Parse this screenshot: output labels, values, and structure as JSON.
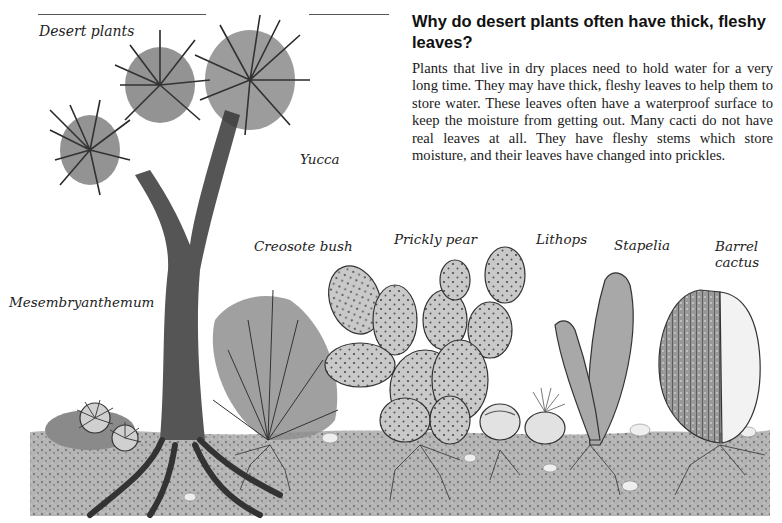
{
  "page": {
    "section_title": "Desert plants",
    "heading": "Why do desert plants often have thick, fleshy leaves?",
    "body": "Plants that live in dry places need to hold water for a very long time. They may have thick, fleshy leaves to help them to store water. These leaves often have a waterproof surface to keep the moisture from getting out. Many cacti do not have real leaves at all. They have fleshy stems which store moisture, and their leaves have changed into prickles."
  },
  "illustration": {
    "description": "Pencil illustration of desert plants growing in gravelly soil with visible root systems",
    "labels": {
      "yucca": "Yucca",
      "creosote_bush": "Creosote bush",
      "prickly_pear": "Prickly pear",
      "lithops": "Lithops",
      "stapelia": "Stapelia",
      "barrel_cactus_line1": "Barrel",
      "barrel_cactus_line2": "cactus",
      "mesembryanthemum": "Mesembryanthemum"
    }
  },
  "colors": {
    "ink": "#1a1a1a",
    "soil": "#9a9a9a",
    "plant_dark": "#3a3a3a",
    "plant_light": "#c8c8c8",
    "background": "#ffffff"
  }
}
